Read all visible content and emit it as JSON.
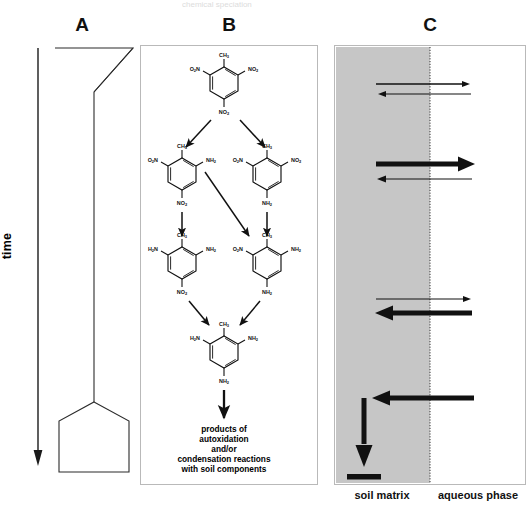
{
  "figure": {
    "top_fragment": "chemical speciation",
    "panels": [
      {
        "letter": "A",
        "name": "time-axis-panel"
      },
      {
        "letter": "B",
        "name": "transformation-pathway-panel"
      },
      {
        "letter": "C",
        "name": "soil-aqueous-partition-panel"
      }
    ]
  },
  "panel_a": {
    "letter": "A",
    "axis_label": "time",
    "shapes": [
      {
        "name": "funnel",
        "description": "inverted triangle at top"
      },
      {
        "name": "stem",
        "description": "narrow vertical neck"
      },
      {
        "name": "reservoir",
        "description": "pentagon / house shape at bottom"
      }
    ]
  },
  "panel_b": {
    "letter": "B",
    "structures": [
      {
        "id": "tnt",
        "name": "2,4,6-trinitrotoluene",
        "top": "CH3",
        "left": "O2N",
        "right": "NO2",
        "bottom": "NO2"
      },
      {
        "id": "2-amino-4-6-dinitrotoluene",
        "name": "2-amino-4,6-dinitrotoluene",
        "top": "CH3",
        "left": "O2N",
        "right": "NH2",
        "bottom": "NO2"
      },
      {
        "id": "4-amino-2-6-dinitrotoluene",
        "name": "4-amino-2,6-dinitrotoluene",
        "top": "CH3",
        "left": "O2N",
        "right": "NO2",
        "bottom": "NH2"
      },
      {
        "id": "2-6-diamino-4-nitrotoluene",
        "name": "2,6-diamino-4-nitrotoluene",
        "top": "CH3",
        "left": "H2N",
        "right": "NH2",
        "bottom": "NO2"
      },
      {
        "id": "2-4-diamino-6-nitrotoluene",
        "name": "2,4-diamino-6-nitrotoluene",
        "top": "CH3",
        "left": "O2N",
        "right": "NH2",
        "bottom": "NH2"
      },
      {
        "id": "triaminotoluene",
        "name": "2,4,6-triaminotoluene",
        "top": "CH3",
        "left": "H2N",
        "right": "NH2",
        "bottom": "NH2"
      }
    ],
    "caption_lines": [
      "products of",
      "autoxidation",
      "and/or",
      "condensation reactions",
      "with soil components"
    ]
  },
  "panel_c": {
    "letter": "C",
    "soil_label": "soil matrix",
    "aqueous_label": "aqueous phase",
    "soil_fill": "#c6c6c6",
    "flows": [
      {
        "id": "flow-1-out",
        "direction": "to-aqueous",
        "weight": "thin",
        "note": "thin arrow soil to aqueous"
      },
      {
        "id": "flow-1-in",
        "direction": "to-soil",
        "weight": "thin",
        "note": "thin arrow aqueous to soil"
      },
      {
        "id": "flow-2-out",
        "direction": "to-aqueous",
        "weight": "thick",
        "note": "thick arrow soil to aqueous"
      },
      {
        "id": "flow-2-in",
        "direction": "to-soil",
        "weight": "thin",
        "note": "thin arrow aqueous to soil"
      },
      {
        "id": "flow-3-out",
        "direction": "to-aqueous",
        "weight": "thin",
        "note": "thin arrow soil to aqueous"
      },
      {
        "id": "flow-3-in",
        "direction": "to-soil",
        "weight": "thick",
        "note": "thick arrow aqueous to soil"
      },
      {
        "id": "flow-4-in",
        "direction": "to-soil",
        "weight": "thick",
        "note": "thick arrow aqueous to soil, bends down"
      },
      {
        "id": "flow-4-sink",
        "direction": "down",
        "weight": "thick",
        "note": "thick arrow down to bound residue bar"
      }
    ],
    "sink_bar": {
      "id": "bound-residue-bar",
      "note": "thick horizontal bar, irreversibly bound residue"
    }
  }
}
